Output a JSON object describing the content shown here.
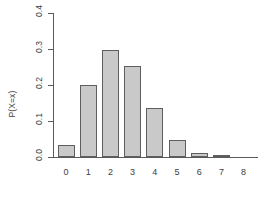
{
  "chart_data": {
    "type": "bar",
    "title": "",
    "xlabel": "",
    "ylabel": "P(X=x)",
    "categories": [
      "0",
      "1",
      "2",
      "3",
      "4",
      "5",
      "6",
      "7",
      "8"
    ],
    "values": [
      0.033,
      0.199,
      0.297,
      0.254,
      0.136,
      0.047,
      0.01,
      0.002,
      0.0
    ],
    "ylim": [
      0.0,
      0.4
    ],
    "yticks": [
      0.0,
      0.1,
      0.2,
      0.3,
      0.4
    ],
    "ytick_labels": [
      "0.0",
      "0.1",
      "0.2",
      "0.3",
      "0.4"
    ],
    "grid": false,
    "legend": false,
    "bar_color": "#c9c9c9",
    "bar_border_color": "#5e5e5e",
    "axis_color": "#5a5a5a"
  }
}
